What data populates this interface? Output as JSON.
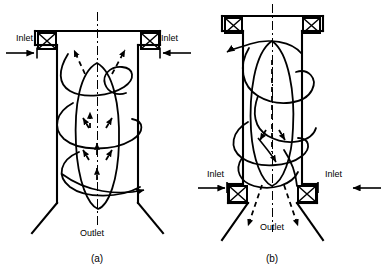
{
  "figure": {
    "background_color": "#ffffff",
    "line_color": "#000000",
    "caption_a": "(a)",
    "caption_b": "(b)",
    "panels": [
      {
        "id": "a",
        "caption": "(a)",
        "description": "Vortex chamber with tangential inlets at the top and an outlet at the conical bottom; helical swirling flow descends then rises along the axis.",
        "labels": {
          "inlet_left": "Inlet",
          "inlet_right": "Inlet",
          "outlet": "Outlet"
        },
        "inlet_position": "top",
        "outlet_position": "bottom",
        "inlet_count": 2,
        "valve_symbol": "x-box",
        "axis_style": "dash-dot centerline",
        "core_flow_direction": "upward",
        "core_flow_style": "dashed",
        "swirl_flow_style": "solid"
      },
      {
        "id": "b",
        "caption": "(b)",
        "description": "Vortex chamber with tangential inlets at the bottom and an outlet below; helical swirling flow rises and exits downward through the conical bottom.",
        "labels": {
          "inlet_left": "Inlet",
          "inlet_right": "Inlet",
          "outlet": "Outlet"
        },
        "inlet_position": "bottom",
        "outlet_position": "bottom",
        "inlet_count": 2,
        "valve_symbol": "x-box",
        "axis_style": "dash-dot centerline",
        "core_flow_direction": "downward-diverging",
        "core_flow_style": "dashed",
        "swirl_flow_style": "solid"
      }
    ]
  }
}
